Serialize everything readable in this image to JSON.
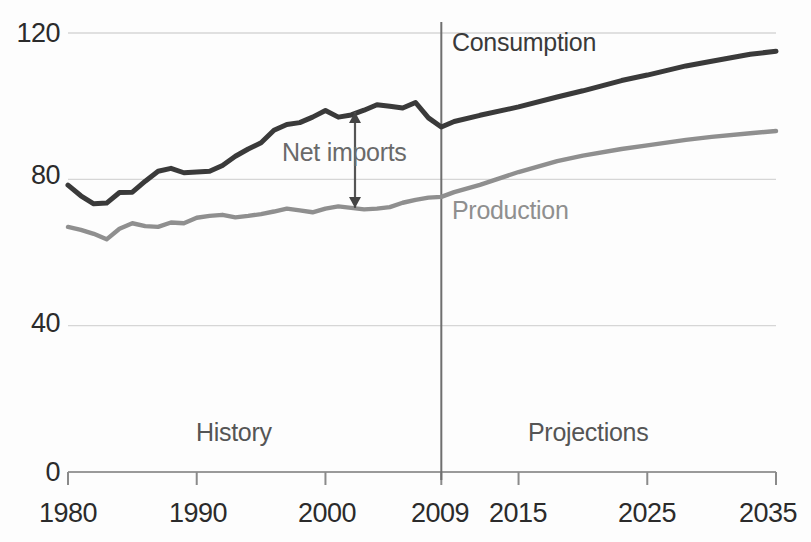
{
  "chart_data": {
    "type": "line",
    "title": "",
    "xlabel": "",
    "ylabel": "",
    "xlim": [
      1980,
      2035
    ],
    "ylim": [
      0,
      130
    ],
    "grid": true,
    "legend_position": "inline-annotations",
    "x_ticks": [
      "1980",
      "1990",
      "2000",
      "2009",
      "2015",
      "2025",
      "2035"
    ],
    "x_tick_values": [
      1980,
      1990,
      2000,
      2009,
      2015,
      2025,
      2035
    ],
    "y_ticks": [
      "0",
      "40",
      "80",
      "120"
    ],
    "y_tick_values": [
      0,
      40,
      80,
      120
    ],
    "annotations": [
      {
        "text": "Consumption",
        "x": 2010,
        "y": 111,
        "color": "#3a3a3a"
      },
      {
        "text": "Production",
        "x": 2011,
        "y": 68,
        "color": "#8f8f8f"
      },
      {
        "text": "Net imports",
        "x": 2000,
        "y": 84,
        "color": "#6a6a6a"
      },
      {
        "text": "History",
        "x": 1995,
        "y": 11,
        "color": "#555555"
      },
      {
        "text": "Projections",
        "x": 2022,
        "y": 11,
        "color": "#555555"
      }
    ],
    "divider_year": 2009,
    "series": [
      {
        "name": "Consumption",
        "color": "#3a3a3a",
        "x": [
          1980,
          1981,
          1982,
          1983,
          1984,
          1985,
          1986,
          1987,
          1988,
          1989,
          1990,
          1991,
          1992,
          1993,
          1994,
          1995,
          1996,
          1997,
          1998,
          1999,
          2000,
          2001,
          2002,
          2003,
          2004,
          2005,
          2006,
          2007,
          2008,
          2009,
          2010,
          2012,
          2015,
          2018,
          2020,
          2023,
          2025,
          2028,
          2030,
          2033,
          2035
        ],
        "values": [
          78.4,
          75.5,
          73.3,
          73.5,
          76.4,
          76.5,
          79.5,
          82.2,
          83.0,
          81.8,
          82.0,
          82.2,
          83.8,
          86.3,
          88.3,
          90.0,
          93.4,
          95.0,
          95.5,
          97.0,
          98.8,
          97.0,
          97.6,
          98.9,
          100.4,
          100.0,
          99.5,
          101.0,
          96.8,
          94.3,
          95.8,
          97.5,
          99.8,
          102.5,
          104.2,
          107.0,
          108.5,
          111.0,
          112.3,
          114.2,
          115.0
        ]
      },
      {
        "name": "Production",
        "color": "#8f8f8f",
        "x": [
          1980,
          1981,
          1982,
          1983,
          1984,
          1985,
          1986,
          1987,
          1988,
          1989,
          1990,
          1991,
          1992,
          1993,
          1994,
          1995,
          1996,
          1997,
          1998,
          1999,
          2000,
          2001,
          2002,
          2003,
          2004,
          2005,
          2006,
          2007,
          2008,
          2009,
          2010,
          2012,
          2015,
          2018,
          2020,
          2023,
          2025,
          2028,
          2030,
          2033,
          2035
        ],
        "values": [
          67.0,
          66.2,
          65.1,
          63.6,
          66.5,
          68.0,
          67.2,
          67.0,
          68.2,
          68.0,
          69.5,
          70.0,
          70.3,
          69.6,
          70.0,
          70.5,
          71.2,
          72.0,
          71.5,
          71.0,
          72.0,
          72.6,
          72.2,
          71.8,
          72.0,
          72.4,
          73.6,
          74.4,
          75.0,
          75.2,
          76.5,
          78.5,
          82.0,
          85.0,
          86.5,
          88.3,
          89.3,
          90.8,
          91.6,
          92.6,
          93.2
        ]
      }
    ]
  },
  "axes": {
    "tick_color": "#777777",
    "grid_color": "#d6d6d6"
  }
}
